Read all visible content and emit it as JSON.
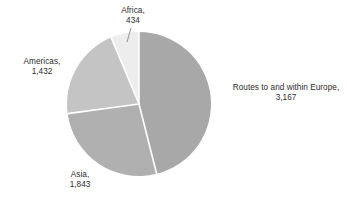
{
  "chart_data": {
    "type": "pie",
    "title": "",
    "subtitle": "",
    "xlabel": "",
    "ylabel": "",
    "legend_position": "none",
    "grid": false,
    "total": 6876,
    "categories": [
      "Routes to and within Europe",
      "Asia",
      "Americas",
      "Africa"
    ],
    "values": [
      3167,
      1843,
      1432,
      434
    ],
    "value_labels": [
      "3,167",
      "1,843",
      "1,432",
      "434"
    ],
    "percentages": [
      46.1,
      26.8,
      20.8,
      6.3
    ],
    "colors": [
      "#a8a8a8",
      "#b0b0b0",
      "#c4c4c4",
      "#ededed"
    ],
    "separator_color": "#ffffff",
    "start_angle_deg": 0,
    "direction": "clockwise",
    "slices": [
      {
        "name": "Routes to and within Europe",
        "label_line1": "Routes to and within Europe,",
        "label_line2": "3,167",
        "value": 3167,
        "value_label": "3,167",
        "percent": 46.1,
        "color": "#a8a8a8",
        "start_deg": 0,
        "end_deg": 165.8
      },
      {
        "name": "Asia",
        "label_line1": "Asia,",
        "label_line2": "1,843",
        "value": 1843,
        "value_label": "1,843",
        "percent": 26.8,
        "color": "#b0b0b0",
        "start_deg": 165.8,
        "end_deg": 262.3
      },
      {
        "name": "Americas",
        "label_line1": "Americas,",
        "label_line2": "1,432",
        "value": 1432,
        "value_label": "1,432",
        "percent": 20.8,
        "color": "#c4c4c4",
        "start_deg": 262.3,
        "end_deg": 337.3
      },
      {
        "name": "Africa",
        "label_line1": "Africa,",
        "label_line2": "434",
        "value": 434,
        "value_label": "434",
        "percent": 6.3,
        "color": "#ededed",
        "start_deg": 337.3,
        "end_deg": 360
      }
    ]
  },
  "labels": {
    "africa": {
      "line1": "Africa,",
      "line2": "434"
    },
    "americas": {
      "line1": "Americas,",
      "line2": "1,432"
    },
    "asia": {
      "line1": "Asia,",
      "line2": "1,843"
    },
    "europe": {
      "line1": "Routes to and within Europe,",
      "line2": "3,167"
    }
  }
}
